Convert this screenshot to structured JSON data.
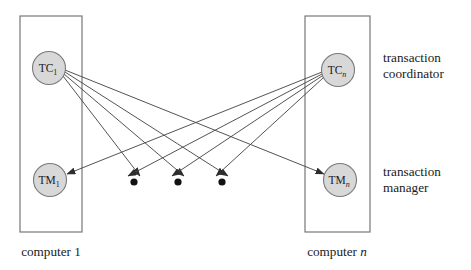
{
  "diagram": {
    "background_color": "#ffffff",
    "line_color": "#4a4a4a",
    "node_fill_color": "#d8d8d8",
    "node_stroke_color": "#7a7a7a",
    "box_stroke_color": "#6b6b6b",
    "dot_color": "#111111"
  },
  "nodes": {
    "tc1": {
      "base": "TC",
      "subscript": "1",
      "cx": 49,
      "cy": 68,
      "r": 16.5
    },
    "tcn": {
      "base": "TC",
      "subscript": "n",
      "cx": 338,
      "cy": 70,
      "r": 16.5
    },
    "tm1": {
      "base": "TM",
      "subscript": "1",
      "cx": 50,
      "cy": 180,
      "r": 16.5
    },
    "tmn": {
      "base": "TM",
      "subscript": "n",
      "cx": 340,
      "cy": 180,
      "r": 16.5
    }
  },
  "boxes": {
    "left": {
      "x": 20,
      "y": 16,
      "width": 62,
      "height": 216,
      "caption": "computer 1",
      "caption_italic_part": "",
      "caption_plain": "computer 1"
    },
    "right": {
      "x": 305,
      "y": 16,
      "width": 65,
      "height": 216,
      "caption": "computer n",
      "caption_plain": "computer ",
      "caption_italic_part": "n"
    }
  },
  "dots": [
    {
      "cx": 134,
      "cy": 182,
      "r": 3.6
    },
    {
      "cx": 178,
      "cy": 182,
      "r": 3.6
    },
    {
      "cx": 222,
      "cy": 182,
      "r": 3.6
    }
  ],
  "side_labels": {
    "coordinator": {
      "line1": "transaction",
      "line2": "coordinator",
      "x": 383,
      "y1": 62,
      "y2": 78
    },
    "manager": {
      "line1": "transaction",
      "line2": "manager",
      "x": 383,
      "y1": 176,
      "y2": 192
    }
  },
  "edges": [
    {
      "id": "tc1-dot1",
      "from": "tc1",
      "to": "dot1",
      "x1": 63,
      "y1": 76,
      "x2": 140,
      "y2": 176
    },
    {
      "id": "tc1-dot2",
      "from": "tc1",
      "to": "dot2",
      "x1": 64,
      "y1": 74,
      "x2": 184,
      "y2": 176
    },
    {
      "id": "tc1-dot3",
      "from": "tc1",
      "to": "dot3",
      "x1": 65,
      "y1": 72,
      "x2": 228,
      "y2": 176
    },
    {
      "id": "tc1-tmn",
      "from": "tc1",
      "to": "tmn",
      "x1": 65,
      "y1": 70,
      "x2": 325,
      "y2": 174
    },
    {
      "id": "tcn-dot1",
      "from": "tcn",
      "to": "dot1",
      "x1": 322,
      "y1": 74,
      "x2": 128,
      "y2": 176
    },
    {
      "id": "tcn-dot2",
      "from": "tcn",
      "to": "dot2",
      "x1": 322,
      "y1": 76,
      "x2": 172,
      "y2": 176
    },
    {
      "id": "tcn-dot3",
      "from": "tcn",
      "to": "dot3",
      "x1": 323,
      "y1": 78,
      "x2": 216,
      "y2": 176
    },
    {
      "id": "tcn-tm1",
      "from": "tcn",
      "to": "tm1",
      "x1": 322,
      "y1": 72,
      "x2": 66,
      "y2": 174
    }
  ]
}
